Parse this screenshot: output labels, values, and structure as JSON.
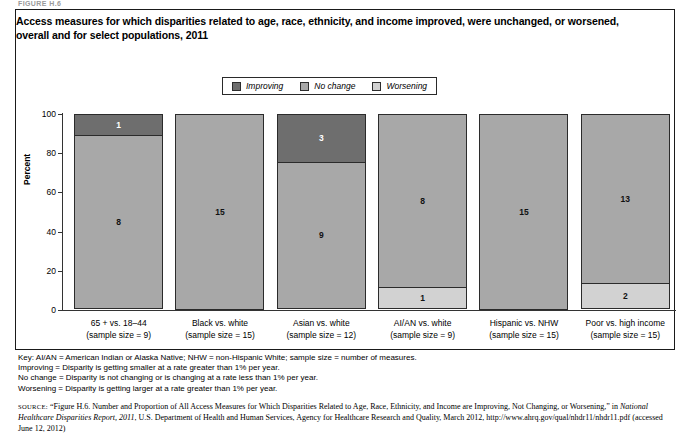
{
  "figure_number": "FIGURE H.6",
  "title": "Access measures for which disparities related to age, race, ethnicity, and income improved, were unchanged, or worsened, overall and for select populations, 2011",
  "legend": {
    "items": [
      {
        "label": "Improving",
        "color": "#6e6e6e",
        "key": "improving"
      },
      {
        "label": "No change",
        "color": "#a8a8a8",
        "key": "nochange"
      },
      {
        "label": "Worsening",
        "color": "#d2d2d2",
        "key": "worsening"
      }
    ]
  },
  "chart_data": {
    "type": "bar",
    "stacked": true,
    "stacked_mode": "percent",
    "title": "Access measures for which disparities related to age, race, ethnicity, and income improved, were unchanged, or worsened, overall and for select populations, 2011",
    "xlabel": "",
    "ylabel": "Percent",
    "ylim": [
      0,
      100
    ],
    "yticks": [
      0,
      20,
      40,
      60,
      80,
      100
    ],
    "grid": false,
    "legend_position": "top-center",
    "categories": [
      "65 + vs. 18–44",
      "Black vs. white",
      "Asian vs. white",
      "AI/AN vs. white",
      "Hispanic vs. NHW",
      "Poor vs. high income"
    ],
    "category_sublabels": [
      "(sample size = 9)",
      "(sample size = 15)",
      "(sample size = 12)",
      "(sample size = 9)",
      "(sample size = 15)",
      "(sample size = 15)"
    ],
    "sample_sizes": [
      9,
      15,
      12,
      9,
      15,
      15
    ],
    "series": [
      {
        "name": "Improving",
        "key": "improving",
        "color": "#6e6e6e",
        "counts": [
          1,
          0,
          3,
          0,
          0,
          0
        ],
        "percents": [
          11.1,
          0,
          25.0,
          0,
          0,
          0
        ]
      },
      {
        "name": "No change",
        "key": "nochange",
        "color": "#a8a8a8",
        "counts": [
          8,
          15,
          9,
          8,
          15,
          13
        ],
        "percents": [
          88.9,
          100,
          75.0,
          88.9,
          100,
          86.7
        ]
      },
      {
        "name": "Worsening",
        "key": "worsening",
        "color": "#d2d2d2",
        "counts": [
          0,
          0,
          0,
          1,
          0,
          2
        ],
        "percents": [
          0,
          0,
          0,
          11.1,
          0,
          13.3
        ]
      }
    ],
    "bars": [
      {
        "category": "65 + vs. 18–44",
        "sublabel": "(sample size = 9)",
        "segments": [
          {
            "key": "improving",
            "label": "1",
            "percent": 11.1
          },
          {
            "key": "nochange",
            "label": "8",
            "percent": 88.9
          }
        ]
      },
      {
        "category": "Black vs. white",
        "sublabel": "(sample size = 15)",
        "segments": [
          {
            "key": "nochange",
            "label": "15",
            "percent": 100
          }
        ]
      },
      {
        "category": "Asian vs. white",
        "sublabel": "(sample size = 12)",
        "segments": [
          {
            "key": "improving",
            "label": "3",
            "percent": 25.0
          },
          {
            "key": "nochange",
            "label": "9",
            "percent": 75.0
          }
        ]
      },
      {
        "category": "AI/AN vs. white",
        "sublabel": "(sample size = 9)",
        "segments": [
          {
            "key": "nochange",
            "label": "8",
            "percent": 88.9
          },
          {
            "key": "worsening",
            "label": "1",
            "percent": 11.1
          }
        ]
      },
      {
        "category": "Hispanic vs. NHW",
        "sublabel": "(sample size = 15)",
        "segments": [
          {
            "key": "nochange",
            "label": "15",
            "percent": 100
          }
        ]
      },
      {
        "category": "Poor vs. high income",
        "sublabel": "(sample size = 15)",
        "segments": [
          {
            "key": "nochange",
            "label": "13",
            "percent": 86.7
          },
          {
            "key": "worsening",
            "label": "2",
            "percent": 13.3
          }
        ]
      }
    ]
  },
  "key_notes": [
    "Key: AI/AN = American Indian or Alaska Native; NHW = non-Hispanic White; sample size = number of measures.",
    "Improving = Disparity is getting smaller at a rate greater than 1% per year.",
    "No change = Disparity is not changing or is changing at a rate less than 1% per year.",
    "Worsening = Disparity is getting larger at a rate greater than 1% per year."
  ],
  "source": {
    "lead": "source:",
    "part1": "“Figure H.6. Number and Proportion of All Access Measures for Which Disparities Related to Age, Race, Ethnicity, and Income are Improving, Not Changing, or Worsening,” in ",
    "italic": "National Healthcare Disparities Report, 2011",
    "part2": ", U.S. Department of Health and Human Services, Agency for Healthcare Research and Quality, March 2012, http://www.ahrq.gov/qual/nhdr11/nhdr11.pdf (accessed June 12, 2012)"
  }
}
